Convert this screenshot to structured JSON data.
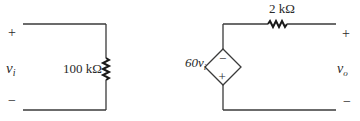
{
  "diagram": {
    "type": "circuit-schematic",
    "input_circuit": {
      "terminal_plus": "+",
      "terminal_minus": "−",
      "voltage_label": "v",
      "voltage_subscript": "i",
      "resistor": {
        "value": "100 kΩ",
        "orientation": "vertical"
      }
    },
    "output_circuit": {
      "dependent_source": {
        "shape": "diamond",
        "kind": "voltage-controlled voltage source",
        "gain_label": "60v",
        "gain_subscript": "i",
        "polarity_top": "−",
        "polarity_bottom": "+"
      },
      "resistor": {
        "value": "2 kΩ",
        "orientation": "horizontal"
      },
      "terminal_plus": "+",
      "terminal_minus": "−",
      "voltage_label": "v",
      "voltage_subscript": "o"
    }
  },
  "colors": {
    "line": "#3a3a3a",
    "text": "#2a2a2a",
    "background": "#ffffff"
  }
}
